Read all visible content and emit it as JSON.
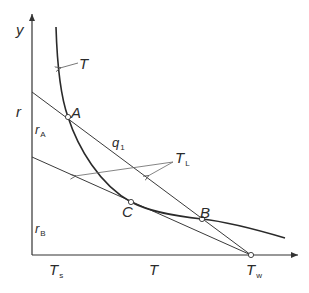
{
  "diagram": {
    "type": "temperature-rate diagram",
    "axes": {
      "y_label": "y",
      "x_label": "T",
      "y_side_label": "r",
      "y_ticks": [
        {
          "name": "r",
          "sub": "A"
        },
        {
          "name": "r",
          "sub": "B"
        }
      ],
      "x_ticks": [
        {
          "name": "T",
          "sub": "s"
        },
        {
          "name": "T",
          "sub": "w"
        }
      ]
    },
    "curve_label": "T",
    "line_label": {
      "name": "q",
      "sub": "1"
    },
    "tangent_label": {
      "name": "T",
      "sub": "L"
    },
    "points": [
      {
        "name": "A",
        "x": 68,
        "y": 117
      },
      {
        "name": "C",
        "x": 131,
        "y": 202
      },
      {
        "name": "B",
        "x": 202,
        "y": 219
      },
      {
        "name": "Tw",
        "x": 251,
        "y": 255
      }
    ],
    "colors": {
      "line": "#3a3a3a",
      "curve": "#2a2a2a",
      "text": "#2b2b2b"
    }
  }
}
